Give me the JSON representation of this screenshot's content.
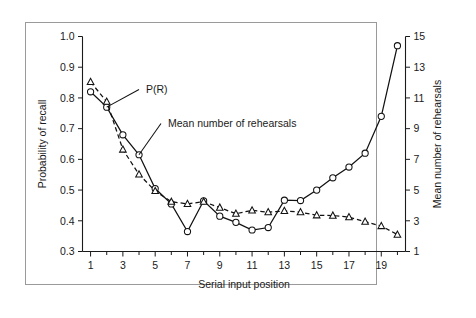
{
  "figure": {
    "has_frame": true,
    "background": "#ffffff",
    "line_color": "#111111"
  },
  "chart_data": {
    "type": "line",
    "title": "",
    "xlabel": "Serial input position",
    "ylabel": "Probability of recall",
    "y2label": "Mean number of rehearsals",
    "grid": false,
    "legend_position": "inline-annotation",
    "x": [
      1,
      2,
      3,
      4,
      5,
      6,
      7,
      8,
      9,
      10,
      11,
      12,
      13,
      14,
      15,
      16,
      17,
      18,
      19,
      20
    ],
    "xlim": [
      0.5,
      20.5
    ],
    "xticks_major": [
      1,
      3,
      5,
      7,
      9,
      11,
      13,
      15,
      17,
      19
    ],
    "xtick_labels": [
      "1",
      "3",
      "5",
      "7",
      "9",
      "11",
      "13",
      "15",
      "17",
      "19"
    ],
    "xticks_all": [
      1,
      2,
      3,
      4,
      5,
      6,
      7,
      8,
      9,
      10,
      11,
      12,
      13,
      14,
      15,
      16,
      17,
      18,
      19,
      20
    ],
    "ylim": [
      0.3,
      1.0
    ],
    "yticks": [
      0.3,
      0.4,
      0.5,
      0.6,
      0.7,
      0.8,
      0.9,
      1.0
    ],
    "ytick_labels": [
      "0.3",
      "0.4",
      "0.5",
      "0.6",
      "0.7",
      "0.8",
      "0.9",
      "1.0"
    ],
    "y2lim": [
      1,
      15
    ],
    "y2ticks": [
      1,
      3,
      5,
      7,
      9,
      11,
      13,
      15
    ],
    "y2tick_labels": [
      "1",
      "3",
      "5",
      "7",
      "9",
      "11",
      "13",
      "15"
    ],
    "series": [
      {
        "name": "P(R)",
        "axis": "left",
        "marker": "circle",
        "linestyle": "solid",
        "values": [
          0.82,
          0.77,
          0.68,
          0.615,
          0.505,
          0.455,
          0.365,
          0.465,
          0.415,
          0.395,
          0.37,
          0.378,
          0.467,
          0.466,
          0.5,
          0.54,
          0.575,
          0.62,
          0.74,
          0.97
        ]
      },
      {
        "name": "Mean number of rehearsals",
        "axis": "right",
        "marker": "triangle",
        "linestyle": "dashed",
        "values_left_scale": [
          0.852,
          0.788,
          0.632,
          0.551,
          0.497,
          0.462,
          0.455,
          0.462,
          0.443,
          0.423,
          0.434,
          0.428,
          0.432,
          0.428,
          0.418,
          0.417,
          0.412,
          0.397,
          0.383,
          0.355
        ],
        "values": [
          12.04,
          10.76,
          7.64,
          6.02,
          4.94,
          4.24,
          4.1,
          4.24,
          3.86,
          3.46,
          3.68,
          3.56,
          3.64,
          3.56,
          3.36,
          3.34,
          3.24,
          2.94,
          2.66,
          2.1
        ]
      }
    ],
    "annotations": [
      {
        "text": "P(R)",
        "target_x": 2,
        "target_series": "P(R)"
      },
      {
        "text": "Mean number of rehearsals",
        "target_x": 4,
        "target_series": "P(R)"
      }
    ]
  }
}
